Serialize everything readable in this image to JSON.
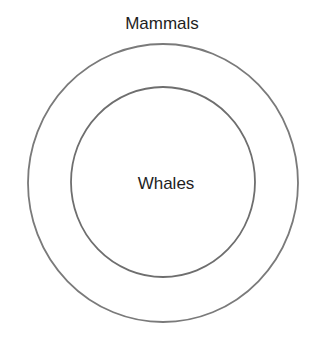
{
  "diagram": {
    "type": "nested-circles",
    "outer": {
      "label": "Mammals",
      "stroke_color": "#7a7a7a"
    },
    "inner": {
      "label": "Whales",
      "stroke_color": "#6e6e6e"
    },
    "background": "#ffffff"
  }
}
